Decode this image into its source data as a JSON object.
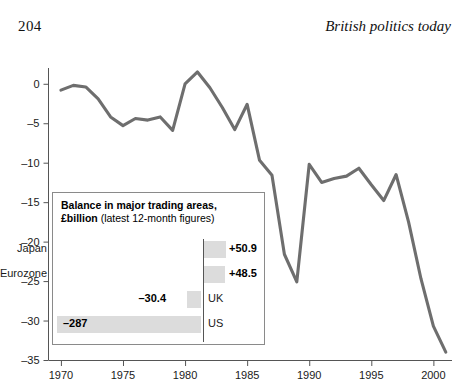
{
  "page": {
    "folio": "204",
    "running_title": "British politics today"
  },
  "chart_data": {
    "type": "line",
    "title": "",
    "xlabel": "",
    "ylabel": "",
    "xlim": [
      1969,
      2001.5
    ],
    "ylim": [
      -35,
      2
    ],
    "grid": false,
    "legend": "none",
    "x_ticks": [
      "1970",
      "1975",
      "1980",
      "1985",
      "1990",
      "1995",
      "2000"
    ],
    "y_ticks": [
      "0",
      "-5",
      "-10",
      "-15",
      "-20",
      "-25",
      "-30",
      "-35"
    ],
    "series": [
      {
        "name": "UK balance of trade (£billion)",
        "color": "#6e6e6e",
        "x": [
          1970,
          1971,
          1972,
          1973,
          1974,
          1975,
          1976,
          1977,
          1978,
          1979,
          1980,
          1981,
          1982,
          1983,
          1984,
          1985,
          1986,
          1987,
          1988,
          1989,
          1990,
          1991,
          1992,
          1993,
          1994,
          1995,
          1996,
          1997,
          1998,
          1999,
          2000,
          2001
        ],
        "y": [
          -0.8,
          -0.2,
          -0.4,
          -1.9,
          -4.2,
          -5.3,
          -4.4,
          -4.6,
          -4.2,
          -5.9,
          0.0,
          1.5,
          -0.5,
          -3.0,
          -5.8,
          -2.6,
          -9.7,
          -11.6,
          -21.6,
          -25.1,
          -10.2,
          -12.5,
          -12.0,
          -11.7,
          -10.7,
          -12.8,
          -14.8,
          -11.5,
          -17.5,
          -24.7,
          -30.7,
          -34.0
        ],
        "values_at_ticks": {
          "1970": -0.8,
          "1975": -5.3,
          "1980": 0.0,
          "1985": -5.8,
          "1990": -10.2,
          "1995": -12.8,
          "2000": -30.7
        }
      }
    ]
  },
  "inset": {
    "title_line1": "Balance in major trading areas,",
    "title_line2_strong": "£billion",
    "title_line2_regular": " (latest 12-month figures)",
    "chart_data": {
      "type": "bar",
      "orientation": "horizontal",
      "categories": [
        "Japan",
        "Eurozone",
        "UK",
        "US"
      ],
      "values": [
        50.9,
        48.5,
        -30.4,
        -287
      ],
      "value_labels": [
        "+50.9",
        "+48.5",
        "–30.4",
        "–287"
      ],
      "bar_color": "#dcdcdc",
      "axis_color": "#555555"
    },
    "rows": [
      {
        "label": "Japan",
        "value": "+50.9",
        "side": "positive"
      },
      {
        "label": "Eurozone",
        "value": "+48.5",
        "side": "positive"
      },
      {
        "label": "UK",
        "value": "–30.4",
        "side": "negative"
      },
      {
        "label": "US",
        "value": "–287",
        "side": "negative"
      }
    ]
  }
}
